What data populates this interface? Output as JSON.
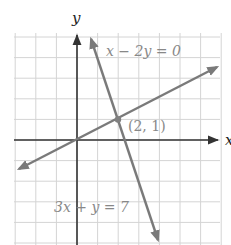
{
  "chart_data": {
    "type": "line",
    "title": "",
    "xlabel": "x",
    "ylabel": "y",
    "xlim": [
      -3,
      7
    ],
    "ylim": [
      -5,
      5
    ],
    "grid": true,
    "series": [
      {
        "name": "x - 2y = 0",
        "label": "x − 2y = 0",
        "equation": "y = x/2",
        "points": [
          [
            -3,
            -1.5
          ],
          [
            7,
            3.5
          ]
        ],
        "arrows": "both"
      },
      {
        "name": "3x + y = 7",
        "label": "3x + y = 7",
        "equation": "y = 7 - 3x",
        "points": [
          [
            0.667,
            5
          ],
          [
            4,
            -5
          ]
        ],
        "arrows": "both"
      }
    ],
    "annotations": [
      {
        "type": "point",
        "x": 2,
        "y": 1,
        "label": "(2, 1)"
      }
    ]
  },
  "labels": {
    "x_axis": "x",
    "y_axis": "y",
    "line1": "x − 2y = 0",
    "line2": "3x + y = 7",
    "intersection": "(2, 1)"
  },
  "colors": {
    "grid": "#d4d4d4",
    "axis": "#333333",
    "line": "#7a7a7a",
    "point": "#808080",
    "text": "#888888",
    "axis_label": "#222222"
  }
}
